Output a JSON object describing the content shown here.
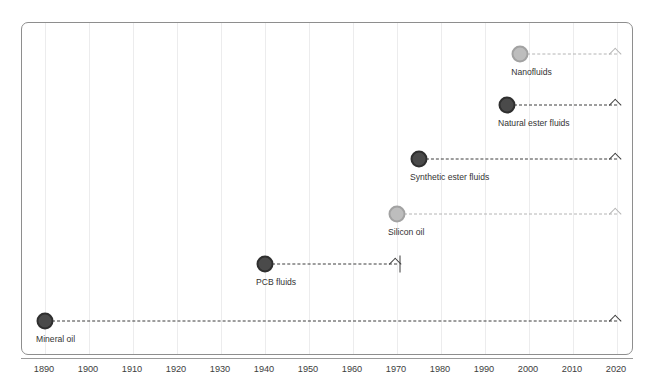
{
  "chart_data": {
    "type": "timeline",
    "title": "",
    "xlabel": "",
    "ylabel": "",
    "xlim": [
      1886,
      2022
    ],
    "x_ticks": [
      1890,
      1900,
      1910,
      1920,
      1930,
      1940,
      1950,
      1960,
      1970,
      1980,
      1990,
      2000,
      2010,
      2020
    ],
    "grid": true,
    "legend": "none",
    "arrow_end_year": 2020,
    "series": [
      {
        "name": "Nanofluids",
        "label": "Nanofluids",
        "start_year": 1998,
        "end_year": 2020,
        "ongoing": true,
        "style": "light",
        "color": "#bdbdbd"
      },
      {
        "name": "Natural ester fluids",
        "label": "Natural ester fluids",
        "start_year": 1995,
        "end_year": 2020,
        "ongoing": true,
        "style": "dark",
        "color": "#4a4a4a"
      },
      {
        "name": "Synthetic ester fluids",
        "label": "Synthetic ester fluids",
        "start_year": 1975,
        "end_year": 2020,
        "ongoing": true,
        "style": "dark",
        "color": "#4a4a4a"
      },
      {
        "name": "Silicon oil",
        "label": "Silicon oil",
        "start_year": 1970,
        "end_year": 2020,
        "ongoing": true,
        "style": "light",
        "color": "#bdbdbd"
      },
      {
        "name": "PCB fluids",
        "label": "PCB fluids",
        "start_year": 1940,
        "end_year": 1970,
        "ongoing": false,
        "style": "dark",
        "color": "#4a4a4a"
      },
      {
        "name": "Mineral oil",
        "label": "Mineral oil",
        "start_year": 1890,
        "end_year": 2020,
        "ongoing": true,
        "style": "dark",
        "color": "#4a4a4a"
      }
    ]
  },
  "axis": {
    "tick_labels": [
      "1890",
      "1900",
      "1910",
      "1920",
      "1930",
      "1940",
      "1950",
      "1960",
      "1970",
      "1980",
      "1990",
      "2000",
      "2010",
      "2020"
    ]
  },
  "rows": [
    {
      "label": "Nanofluids"
    },
    {
      "label": "Natural ester fluids"
    },
    {
      "label": "Synthetic ester fluids"
    },
    {
      "label": "Silicon oil"
    },
    {
      "label": "PCB fluids"
    },
    {
      "label": "Mineral oil"
    }
  ]
}
